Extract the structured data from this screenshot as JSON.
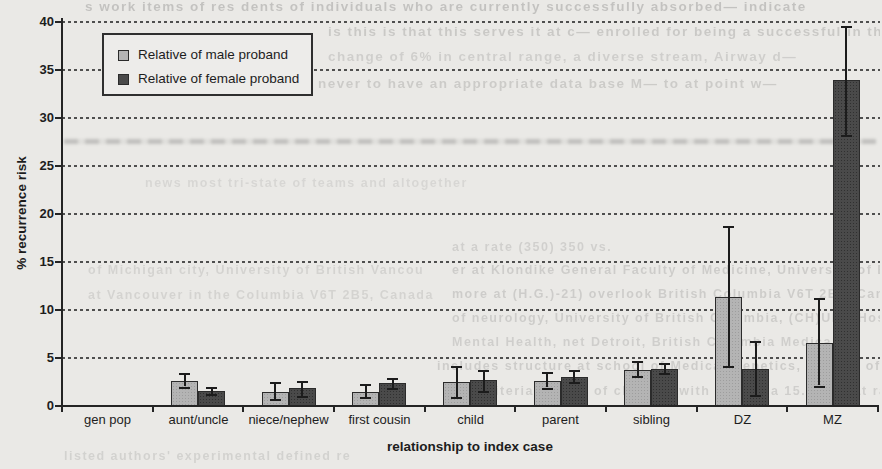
{
  "figure": {
    "background_color": "#eae9e6",
    "ink_color": "#1d1d1d",
    "kind": "scanned grouped bar chart with error bars"
  },
  "chart_data": {
    "type": "bar",
    "title": "",
    "xlabel": "relationship to index case",
    "ylabel": "% recurrence risk",
    "ylim": [
      0,
      40
    ],
    "yticks": [
      0,
      5,
      10,
      15,
      20,
      25,
      30,
      35,
      40
    ],
    "grid": "horizontal dashed lines every 5",
    "legend_position": "inside plot, top-left, boxed",
    "categories": [
      "gen pop",
      "aunt/uncle",
      "niece/nephew",
      "first cousin",
      "child",
      "parent",
      "sibling",
      "DZ",
      "MZ"
    ],
    "series": [
      {
        "name": "Relative of male proband",
        "color": "#b4b4b4",
        "values": [
          0,
          2.6,
          1.5,
          1.5,
          2.5,
          2.6,
          3.8,
          11.4,
          6.6
        ],
        "error_low": [
          null,
          2.0,
          0.7,
          0.9,
          0.9,
          1.9,
          3.1,
          4.2,
          2.1
        ],
        "error_high": [
          null,
          3.4,
          2.5,
          2.3,
          4.2,
          3.5,
          4.7,
          18.8,
          11.2
        ]
      },
      {
        "name": "Relative of female proband",
        "color": "#4a4a4a",
        "values": [
          0,
          1.6,
          1.9,
          2.4,
          2.7,
          3.0,
          3.9,
          3.9,
          34.0
        ],
        "error_low": [
          null,
          1.2,
          1.0,
          1.9,
          1.6,
          2.5,
          3.4,
          1.1,
          28.2
        ],
        "error_high": [
          null,
          2.0,
          2.6,
          2.9,
          3.8,
          3.7,
          4.5,
          6.8,
          39.6
        ]
      }
    ]
  },
  "bleedthrough_text": {
    "legibility": "faint show-through print from adjacent page, mostly illegible",
    "band": {
      "x": 64,
      "y": 139,
      "w": 812,
      "h": 5
    },
    "lines": [
      {
        "text": "s work items of res dents of individuals who are currently successfully absorbed— indicate",
        "x": 85,
        "y": -1,
        "w": 795,
        "size": 13.5,
        "opacity": 0.22
      },
      {
        "text": "is this is that this serves it at c— enrolled for being a successful in this so— convinced",
        "x": 328,
        "y": 24,
        "w": 552,
        "size": 13.5,
        "opacity": 0.18
      },
      {
        "text": "change of 6% in central range, a diverse stream, Airway d—",
        "x": 328,
        "y": 49,
        "w": 552,
        "size": 13.5,
        "opacity": 0.15
      },
      {
        "text": "never to have an appropriate data base M— to at point w—",
        "x": 318,
        "y": 76,
        "w": 562,
        "size": 13.5,
        "opacity": 0.17
      },
      {
        "text": "news most tri-state of teams and altogether",
        "x": 145,
        "y": 176,
        "w": 330,
        "size": 12.5,
        "opacity": 0.1
      },
      {
        "text": "at a rate (350) 350 vs.",
        "x": 452,
        "y": 240,
        "w": 428,
        "size": 12.5,
        "opacity": 0.14
      },
      {
        "text": "er at Klondike General Faculty of Medicine, University of British Columbia",
        "x": 452,
        "y": 263,
        "w": 428,
        "size": 12.5,
        "opacity": 0.16
      },
      {
        "text": "more at (H.G.)-21) overlook British Columbia V6T 2B5, Canada",
        "x": 452,
        "y": 287,
        "w": 428,
        "size": 12.5,
        "opacity": 0.16
      },
      {
        "text": "of neurology, University of British Columbia, (CH)UBC Hospital, 911-471",
        "x": 452,
        "y": 311,
        "w": 428,
        "size": 12.5,
        "opacity": 0.16
      },
      {
        "text": "Mental Health, net Detroit, British Columbia Medical",
        "x": 452,
        "y": 335,
        "w": 428,
        "size": 12.5,
        "opacity": 0.15
      },
      {
        "text": "includes structure at school of Medical Genetics, Faculty of Medicine, University of",
        "x": 437,
        "y": 359,
        "w": 443,
        "size": 12.5,
        "opacity": 0.16
      },
      {
        "text": "the criteria (94,21) of children with UCH at a 15.6 in that ratio of autism Children's Hospital",
        "x": 452,
        "y": 384,
        "w": 428,
        "size": 12.5,
        "opacity": 0.15
      },
      {
        "text": "of Michigan city, University of British Vancou",
        "x": 88,
        "y": 263,
        "w": 352,
        "size": 12.5,
        "opacity": 0.12
      },
      {
        "text": "at Vancouver in the Columbia V6T 2B5, Canada",
        "x": 88,
        "y": 288,
        "w": 352,
        "size": 12.5,
        "opacity": 0.12
      },
      {
        "text": "listed authors' experimental defined re",
        "x": 64,
        "y": 449,
        "w": 420,
        "size": 12.5,
        "opacity": 0.13
      }
    ]
  }
}
